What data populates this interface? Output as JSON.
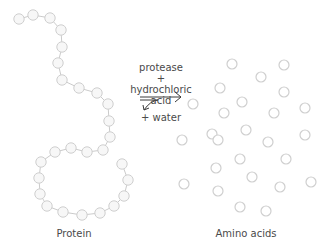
{
  "diagram": {
    "colors": {
      "background": "#ffffff",
      "bead_stroke": "#cfcfcf",
      "bead_fill": "#f7f7f7",
      "link": "#bdbdbd",
      "text": "#4a4a4a",
      "arrow": "#3a3a3a"
    },
    "reaction": {
      "line1": "protease",
      "line2": "+",
      "line3": "hydrochloric",
      "line4": "acid",
      "line5": "+ water"
    },
    "labels": {
      "left": "Protein",
      "right": "Amino acids"
    },
    "protein_chain": [
      [
        19,
        19
      ],
      [
        33,
        15
      ],
      [
        50,
        18
      ],
      [
        61,
        30
      ],
      [
        62,
        47
      ],
      [
        58,
        63
      ],
      [
        62,
        80
      ],
      [
        79,
        88
      ],
      [
        97,
        93
      ],
      [
        108,
        104
      ],
      [
        109,
        121
      ],
      [
        110,
        137
      ],
      [
        103,
        150
      ],
      [
        87,
        152
      ],
      [
        71,
        148
      ],
      [
        55,
        152
      ],
      [
        41,
        162
      ],
      [
        39,
        178
      ],
      [
        40,
        194
      ],
      [
        47,
        206
      ],
      [
        63,
        212
      ],
      [
        82,
        215
      ],
      [
        100,
        213
      ],
      [
        114,
        206
      ],
      [
        124,
        196
      ],
      [
        128,
        180
      ],
      [
        122,
        164
      ]
    ],
    "amino_acids": [
      [
        232,
        64
      ],
      [
        284,
        65
      ],
      [
        261,
        77
      ],
      [
        220,
        88
      ],
      [
        284,
        92
      ],
      [
        193,
        104
      ],
      [
        242,
        102
      ],
      [
        224,
        113
      ],
      [
        274,
        113
      ],
      [
        305,
        108
      ],
      [
        212,
        134
      ],
      [
        246,
        130
      ],
      [
        182,
        140
      ],
      [
        218,
        140
      ],
      [
        268,
        142
      ],
      [
        305,
        135
      ],
      [
        240,
        159
      ],
      [
        286,
        159
      ],
      [
        216,
        168
      ],
      [
        252,
        177
      ],
      [
        184,
        184
      ],
      [
        218,
        191
      ],
      [
        280,
        187
      ],
      [
        311,
        182
      ],
      [
        240,
        207
      ],
      [
        266,
        211
      ]
    ]
  }
}
